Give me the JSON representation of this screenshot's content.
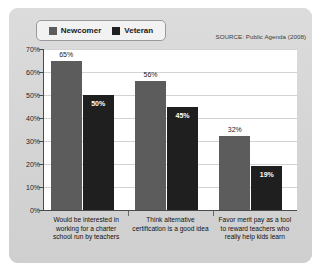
{
  "legend": {
    "entries": [
      {
        "label": "Newcomer",
        "color": "#5c5c5c",
        "swatch_icon": "square-swatch-icon"
      },
      {
        "label": "Veteran",
        "color": "#1f1f1f",
        "swatch_icon": "square-swatch-icon"
      }
    ]
  },
  "source_note": "SOURCE: Public Agenda (2008)",
  "chart_data": {
    "type": "bar",
    "title": "",
    "subtitle": "",
    "xlabel": "",
    "ylabel": "",
    "ylim": [
      0,
      70
    ],
    "ytick_labels": [
      "70%",
      "60%",
      "50%",
      "40%",
      "30%",
      "20%",
      "10%",
      "0%"
    ],
    "ytick_values": [
      70,
      60,
      50,
      40,
      30,
      20,
      10,
      0
    ],
    "grid": true,
    "legend_position": "top-left",
    "value_suffix": "%",
    "categories": [
      "Would be interested in\nworking for a charter\nschool run by teachers",
      "Think alternative\ncertification is a good idea",
      "Favor merit pay as a tool\nto reward teachers who\nreally help kids learn"
    ],
    "series": [
      {
        "name": "Newcomer",
        "color": "#5c5c5c",
        "values": [
          65,
          56,
          32
        ],
        "value_labels": [
          "65%",
          "56%",
          "32%"
        ]
      },
      {
        "name": "Veteran",
        "color": "#1f1f1f",
        "values": [
          50,
          45,
          19
        ],
        "value_labels": [
          "50%",
          "45%",
          "19%"
        ]
      }
    ],
    "annotations": [
      "SOURCE: Public Agenda (2008)"
    ]
  }
}
